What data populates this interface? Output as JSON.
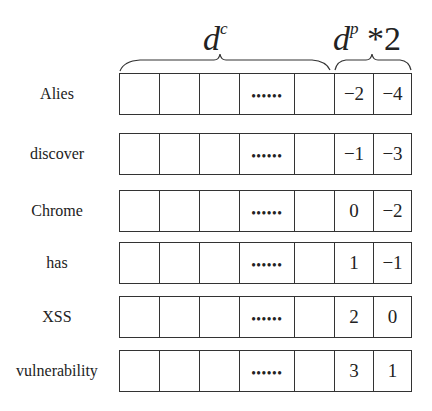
{
  "headers": {
    "content_label": "d",
    "content_sup": "c",
    "position_label": "d",
    "position_sup": "p",
    "position_suffix": " *2"
  },
  "ellipsis": "••••••",
  "rows": [
    {
      "word": "Alies",
      "p1": "−2",
      "p2": "−4"
    },
    {
      "word": "discover",
      "p1": "−1",
      "p2": "−3"
    },
    {
      "word": "Chrome",
      "p1": "0",
      "p2": "−2"
    },
    {
      "word": "has",
      "p1": "1",
      "p2": "−1"
    },
    {
      "word": "XSS",
      "p1": "2",
      "p2": "0"
    },
    {
      "word": "vulnerability",
      "p1": "3",
      "p2": "1"
    }
  ]
}
